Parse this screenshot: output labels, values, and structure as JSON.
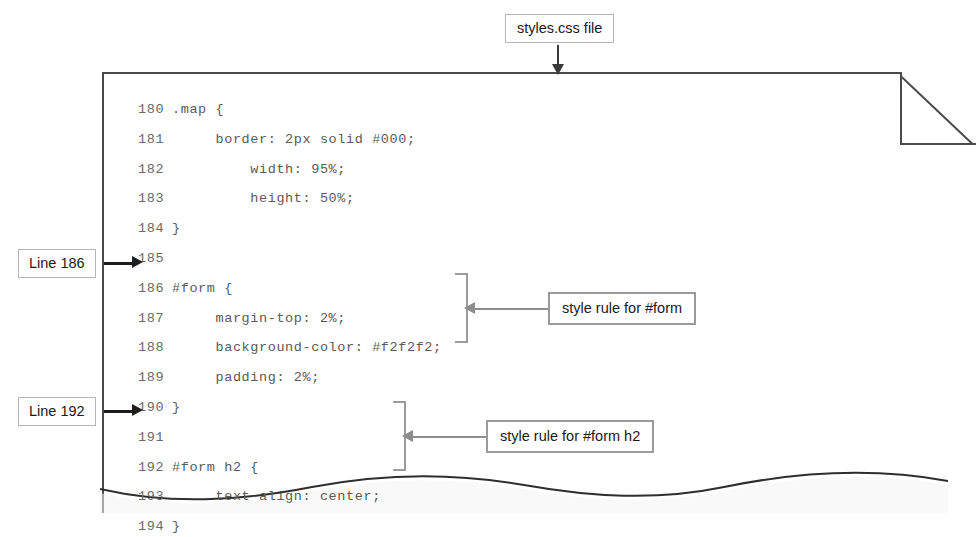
{
  "figure": {
    "top_label": {
      "text": "styles.css file",
      "arrow": "down-arrow-icon"
    },
    "side_labels": [
      {
        "text": "Line 186",
        "arrow": "right-arrow-icon",
        "target_line": "186"
      },
      {
        "text": "Line 192",
        "arrow": "right-arrow-icon",
        "target_line": "192"
      }
    ],
    "callouts": [
      {
        "text": "style rule for #form",
        "arrow": "left-arrow-icon",
        "brace": "curly-brace-icon",
        "lines": "187-189"
      },
      {
        "text": "style rule for #form h2",
        "arrow": "left-arrow-icon",
        "brace": "curly-brace-icon",
        "lines": "192-194"
      }
    ],
    "page": {
      "corner": "folded-corner",
      "bottom": "torn-wavy-edge"
    },
    "colors": {
      "page_border": "#4a4a4a",
      "code_text": "#5f5f5f",
      "label_border": "#b6b6b6",
      "callout_border": "#9a9a9a",
      "arrow_dark": "#1c1c1c",
      "arrow_gray": "#8d8d8d"
    }
  },
  "code": {
    "language": "css",
    "lines": [
      {
        "number": "180",
        "text": ".map {"
      },
      {
        "number": "181",
        "text": "     border: 2px solid #000;"
      },
      {
        "number": "182",
        "text": "         width: 95%;"
      },
      {
        "number": "183",
        "text": "         height: 50%;"
      },
      {
        "number": "184",
        "text": "}"
      },
      {
        "number": "185",
        "text": ""
      },
      {
        "number": "186",
        "text": "#form {"
      },
      {
        "number": "187",
        "text": "     margin-top: 2%;"
      },
      {
        "number": "188",
        "text": "     background-color: #f2f2f2;"
      },
      {
        "number": "189",
        "text": "     padding: 2%;"
      },
      {
        "number": "190",
        "text": "}"
      },
      {
        "number": "191",
        "text": ""
      },
      {
        "number": "192",
        "text": "#form h2 {"
      },
      {
        "number": "193",
        "text": "     text-align: center;"
      },
      {
        "number": "194",
        "text": "}"
      }
    ]
  }
}
